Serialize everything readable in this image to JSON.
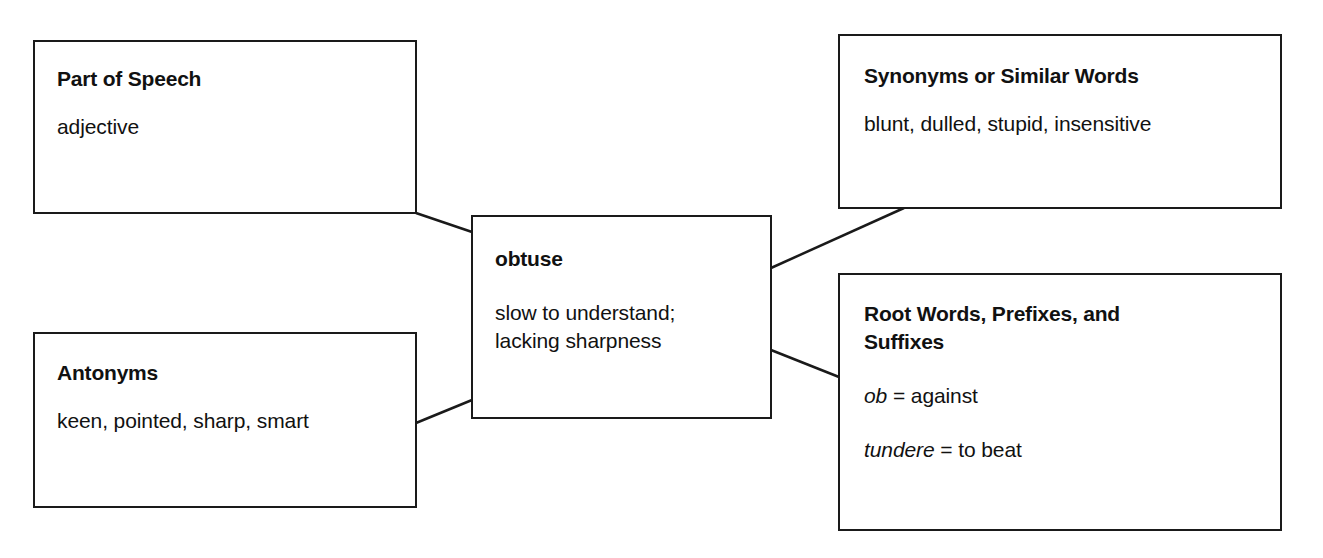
{
  "diagram": {
    "type": "vocabulary-word-map",
    "center": {
      "word": "obtuse",
      "definition_line1": "slow to understand;",
      "definition_line2": "lacking sharpness"
    },
    "part_of_speech": {
      "title": "Part of Speech",
      "value": "adjective"
    },
    "synonyms": {
      "title": "Synonyms or Similar Words",
      "value": "blunt, dulled, stupid, insensitive"
    },
    "antonyms": {
      "title": "Antonyms",
      "value": "keen, pointed, sharp, smart"
    },
    "roots": {
      "title_line1": "Root Words, Prefixes, and",
      "title_line2": "Suffixes",
      "entries": [
        {
          "term": "ob",
          "sep": " = ",
          "meaning": "against"
        },
        {
          "term": "tundere",
          "sep": " = ",
          "meaning": "to beat"
        }
      ]
    },
    "connectors": [
      {
        "from": "part_of_speech",
        "to": "center"
      },
      {
        "from": "synonyms",
        "to": "center"
      },
      {
        "from": "antonyms",
        "to": "center"
      },
      {
        "from": "roots",
        "to": "center"
      }
    ],
    "colors": {
      "stroke": "#1a1a1a",
      "background": "#ffffff",
      "text": "#111111"
    }
  }
}
